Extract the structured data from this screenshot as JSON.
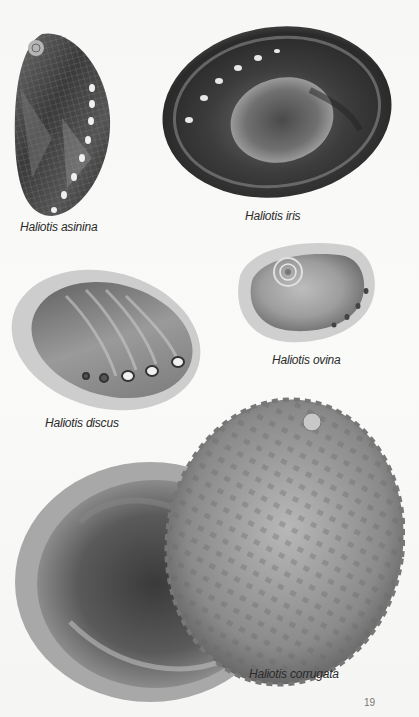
{
  "page": {
    "page_number": "19",
    "figures": [
      {
        "id": "asinina",
        "caption": "Haliotis asinina"
      },
      {
        "id": "iris",
        "caption": "Haliotis iris"
      },
      {
        "id": "ovina",
        "caption": "Haliotis ovina"
      },
      {
        "id": "discus",
        "caption": "Haliotis discus"
      },
      {
        "id": "corrugata",
        "caption": "Haliotis corrugata"
      }
    ]
  },
  "colors": {
    "background": "#f8f8f6",
    "caption_text": "#2a2a2a",
    "page_number": "#777777"
  }
}
